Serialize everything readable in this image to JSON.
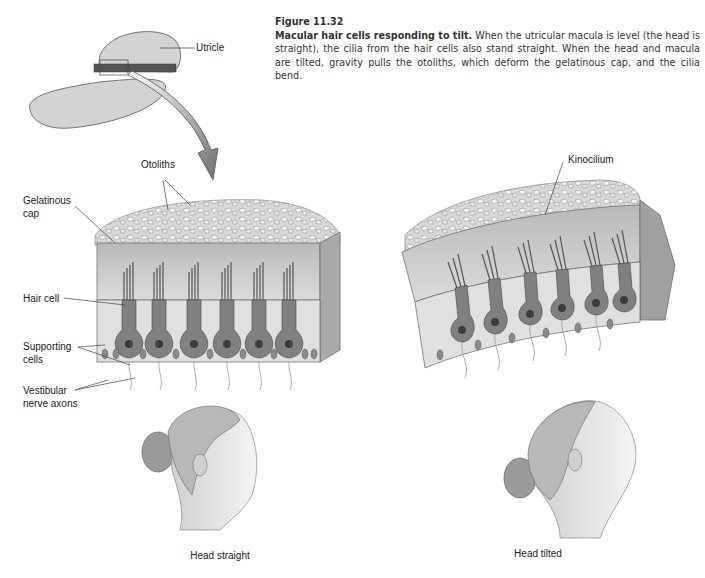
{
  "figure": {
    "number": "Figure 11.32",
    "title": "Macular hair cells responding to tilt.",
    "description": " When the utricular macula is level (the head is straight), the cilia from the hair cells also stand straight. When the head and macula are tilted, gravity pulls the otoliths, which deform the gelatinous cap, and the cilia bend."
  },
  "labels": {
    "utricle": "Utricle",
    "otoliths": "Otoliths",
    "gelatinous_cap_line1": "Gelatinous",
    "gelatinous_cap_line2": "cap",
    "hair_cell": "Hair cell",
    "supporting_cells_line1": "Supporting",
    "supporting_cells_line2": "cells",
    "vestibular_line1": "Vestibular",
    "vestibular_line2": "nerve axons",
    "kinocilium": "Kinocilium"
  },
  "panels": {
    "left": {
      "caption": "Head straight"
    },
    "right": {
      "caption": "Head tilted"
    }
  },
  "colors": {
    "otolith": "#e8e8e8",
    "cap": "#c9c9c9",
    "hair_cell": "#7a7a7a",
    "support": "#d6d6d6",
    "arrow": "#8a8a8a"
  }
}
